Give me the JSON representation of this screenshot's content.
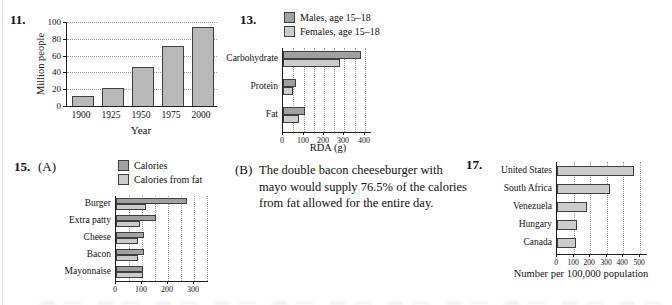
{
  "problems": {
    "p11": {
      "number": "11."
    },
    "p13": {
      "number": "13."
    },
    "p15": {
      "number": "15.",
      "part_a_label": "(A)",
      "part_b_label": "(B)",
      "part_b_text": "The double bacon cheeseburger with mayo would supply 76.5% of the calories from fat allowed for the entire day."
    },
    "p17": {
      "number": "17."
    }
  },
  "colors": {
    "series_dark": "#a1a1a1",
    "series_light": "#cccccc",
    "bar_gray": "#b9b9b9",
    "bar_border": "#3f3f3f",
    "grid": "#9f9f9f",
    "axis": "#1f1f1f",
    "text": "#111111"
  },
  "chart_data": [
    {
      "id": "chart11",
      "type": "bar",
      "title": "",
      "categories": [
        "1900",
        "1925",
        "1950",
        "1975",
        "2000"
      ],
      "values": [
        12,
        21,
        46,
        72,
        94
      ],
      "xlabel": "Year",
      "ylabel": "Million people",
      "ylim": [
        0,
        100
      ],
      "yticks": [
        0,
        20,
        40,
        60,
        80,
        100
      ],
      "grid": "horizontal-dotted"
    },
    {
      "id": "chart13",
      "type": "bar-horizontal-grouped",
      "title": "",
      "categories": [
        "Carbohydrate",
        "Protein",
        "Fat"
      ],
      "series": [
        {
          "name": "Males, age 15–18",
          "values": [
            375,
            60,
            100
          ],
          "color_key": "series_dark"
        },
        {
          "name": "Females, age 15–18",
          "values": [
            275,
            45,
            75
          ],
          "color_key": "series_light"
        }
      ],
      "xlabel": "RDA (g)",
      "xlim": [
        0,
        400
      ],
      "xticks": [
        0,
        100,
        200,
        300,
        400
      ],
      "grid_minor_interval": 50,
      "legend_position": "top"
    },
    {
      "id": "chart15",
      "type": "bar-horizontal-grouped",
      "title": "",
      "categories": [
        "Burger",
        "Extra patty",
        "Cheese",
        "Bacon",
        "Mayonnaise"
      ],
      "series": [
        {
          "name": "Calories",
          "values": [
            270,
            150,
            105,
            105,
            100
          ],
          "color_key": "series_dark"
        },
        {
          "name": "Calories from fat",
          "values": [
            110,
            90,
            80,
            80,
            100
          ],
          "color_key": "series_light"
        }
      ],
      "xlabel": "",
      "xlim": [
        0,
        300
      ],
      "xticks": [
        0,
        100,
        200,
        300
      ],
      "grid_minor_interval": 50,
      "legend_position": "top"
    },
    {
      "id": "chart17",
      "type": "bar-horizontal",
      "title": "",
      "categories": [
        "United States",
        "South Africa",
        "Venezuela",
        "Hungary",
        "Canada"
      ],
      "series": [
        {
          "name": "",
          "values": [
            455,
            315,
            175,
            115,
            110
          ],
          "color_key": "series_light"
        }
      ],
      "xlabel": "Number per 100,000 population",
      "xlim": [
        0,
        500
      ],
      "xticks": [
        0,
        100,
        200,
        300,
        400,
        500
      ],
      "grid_minor_interval": 100
    }
  ]
}
